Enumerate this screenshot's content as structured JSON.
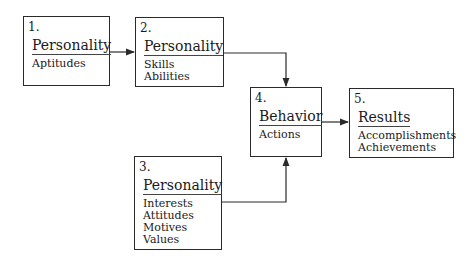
{
  "diagram": {
    "type": "flowchart",
    "nodes": [
      {
        "id": "1",
        "number": "1.",
        "title": "Personality",
        "items": [
          "Aptitudes"
        ]
      },
      {
        "id": "2",
        "number": "2.",
        "title": "Personality",
        "items": [
          "Skills",
          "Abilities"
        ]
      },
      {
        "id": "3",
        "number": "3.",
        "title": "Personality",
        "items": [
          "Interests",
          "Attitudes",
          "Motives",
          "Values"
        ]
      },
      {
        "id": "4",
        "number": "4.",
        "title": "Behavior",
        "items": [
          "Actions"
        ]
      },
      {
        "id": "5",
        "number": "5.",
        "title": "Results",
        "items": [
          "Accomplishments",
          "Achievements"
        ]
      }
    ],
    "edges": [
      {
        "from": "1",
        "to": "2"
      },
      {
        "from": "2",
        "to": "4"
      },
      {
        "from": "3",
        "to": "4"
      },
      {
        "from": "4",
        "to": "5"
      }
    ]
  }
}
